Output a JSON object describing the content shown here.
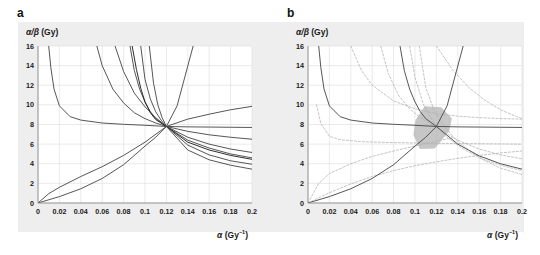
{
  "figure": {
    "background_color": "#ffffff",
    "band_color": "#eeeeee",
    "panels": [
      {
        "id": "a",
        "letter": "a",
        "axis_label_y": "α/β (Gy)",
        "axis_label_x": "α (Gy⁻¹)"
      },
      {
        "id": "b",
        "letter": "b",
        "axis_label_y": "α/β (Gy)",
        "axis_label_x": "α (Gy⁻¹)"
      }
    ]
  },
  "chart_data": [
    {
      "panel": "a",
      "type": "line",
      "title": "",
      "xlabel": "α (Gy⁻¹)",
      "ylabel": "α/β (Gy)",
      "xlim": [
        0,
        0.2
      ],
      "ylim": [
        0,
        16
      ],
      "xticks": [
        0,
        0.02,
        0.04,
        0.06,
        0.08,
        0.1,
        0.12,
        0.14,
        0.16,
        0.18,
        0.2
      ],
      "xticklabels": [
        "0",
        "0.02",
        "0.04",
        "0.06",
        "0.08",
        "0.1",
        "0.12",
        "0.14",
        "0.16",
        "0.18",
        "0.2"
      ],
      "yticks": [
        0,
        2,
        4,
        6,
        8,
        10,
        12,
        14,
        16
      ],
      "yticklabels": [
        "0",
        "2",
        "4",
        "6",
        "8",
        "10",
        "12",
        "14",
        "16"
      ],
      "grid": true,
      "legend": "none",
      "annotations": [
        "All isoeffect curves intersect at the common point (0.12, 7.8)"
      ],
      "common_point": {
        "alpha": 0.12,
        "alpha_beta": 7.8
      },
      "line_color": "#4d4d4d",
      "series": [
        {
          "name": "curve-1-steep-decay",
          "style": "solid",
          "color": "#4d4d4d",
          "x": [
            0.01,
            0.012,
            0.015,
            0.02,
            0.03,
            0.04,
            0.06,
            0.08,
            0.1,
            0.12,
            0.14,
            0.16,
            0.18,
            0.2
          ],
          "values": [
            16.0,
            13.8,
            11.6,
            9.9,
            8.8,
            8.45,
            8.15,
            8.02,
            7.92,
            7.8,
            7.76,
            7.74,
            7.72,
            7.7
          ]
        },
        {
          "name": "curve-2-decay",
          "style": "solid",
          "color": "#4d4d4d",
          "x": [
            0.055,
            0.06,
            0.07,
            0.08,
            0.09,
            0.1,
            0.11,
            0.12,
            0.14,
            0.16,
            0.18,
            0.2
          ],
          "values": [
            16.0,
            14.0,
            11.6,
            10.2,
            9.2,
            8.6,
            8.15,
            7.8,
            7.3,
            6.95,
            6.7,
            6.5
          ]
        },
        {
          "name": "curve-3-decay",
          "style": "solid",
          "color": "#4d4d4d",
          "x": [
            0.072,
            0.08,
            0.09,
            0.1,
            0.11,
            0.12,
            0.14,
            0.16,
            0.18,
            0.2
          ],
          "values": [
            16.0,
            13.4,
            11.2,
            9.8,
            8.7,
            7.8,
            6.7,
            6.0,
            5.5,
            5.15
          ]
        },
        {
          "name": "curve-4-decay",
          "style": "solid",
          "color": "#4d4d4d",
          "x": [
            0.086,
            0.09,
            0.095,
            0.1,
            0.105,
            0.11,
            0.12,
            0.14,
            0.16,
            0.18,
            0.2
          ],
          "values": [
            16.0,
            13.5,
            11.6,
            10.3,
            9.3,
            8.6,
            7.8,
            6.4,
            5.6,
            5.0,
            4.6
          ]
        },
        {
          "name": "curve-5-decay-dark",
          "style": "solid",
          "color": "#222222",
          "x": [
            0.088,
            0.092,
            0.096,
            0.1,
            0.105,
            0.11,
            0.12,
            0.14,
            0.16,
            0.18,
            0.2
          ],
          "values": [
            16.0,
            13.6,
            11.7,
            10.3,
            9.2,
            8.5,
            7.8,
            6.2,
            5.4,
            4.85,
            4.45
          ]
        },
        {
          "name": "curve-6-decay",
          "style": "solid",
          "color": "#4d4d4d",
          "x": [
            0.096,
            0.1,
            0.105,
            0.11,
            0.115,
            0.12,
            0.14,
            0.16,
            0.18,
            0.2
          ],
          "values": [
            16.0,
            12.6,
            10.6,
            9.3,
            8.45,
            7.8,
            5.9,
            4.9,
            4.3,
            3.95
          ]
        },
        {
          "name": "curve-7-decay",
          "style": "solid",
          "color": "#4d4d4d",
          "x": [
            0.104,
            0.108,
            0.112,
            0.116,
            0.12,
            0.14,
            0.16,
            0.18,
            0.2
          ],
          "values": [
            16.0,
            12.2,
            10.0,
            8.7,
            7.8,
            5.4,
            4.4,
            3.85,
            3.45
          ]
        },
        {
          "name": "curve-8-rising-shallow",
          "style": "solid",
          "color": "#4d4d4d",
          "x": [
            0.0,
            0.01,
            0.02,
            0.04,
            0.06,
            0.08,
            0.1,
            0.12,
            0.14,
            0.16,
            0.18,
            0.2
          ],
          "values": [
            0.0,
            0.95,
            1.6,
            2.7,
            3.7,
            4.85,
            6.2,
            7.8,
            8.55,
            9.05,
            9.5,
            9.85
          ]
        },
        {
          "name": "curve-9-rising-convex",
          "style": "solid",
          "color": "#4d4d4d",
          "x": [
            0.0,
            0.02,
            0.04,
            0.06,
            0.08,
            0.1,
            0.11,
            0.12,
            0.13,
            0.145
          ],
          "values": [
            0.0,
            0.65,
            1.45,
            2.5,
            3.9,
            5.8,
            6.7,
            7.8,
            9.9,
            16.0
          ]
        }
      ]
    },
    {
      "panel": "b",
      "type": "line",
      "title": "",
      "xlabel": "α (Gy⁻¹)",
      "ylabel": "α/β (Gy)",
      "xlim": [
        0,
        0.2
      ],
      "ylim": [
        0,
        16
      ],
      "xticks": [
        0,
        0.02,
        0.04,
        0.06,
        0.08,
        0.1,
        0.12,
        0.14,
        0.16,
        0.18,
        0.2
      ],
      "xticklabels": [
        "0",
        "0.02",
        "0.04",
        "0.06",
        "0.08",
        "0.1",
        "0.12",
        "0.14",
        "0.16",
        "0.18",
        "0.2"
      ],
      "yticks": [
        0,
        2,
        4,
        6,
        8,
        10,
        12,
        14,
        16
      ],
      "yticklabels": [
        "0",
        "2",
        "4",
        "6",
        "8",
        "10",
        "12",
        "14",
        "16"
      ],
      "grid": true,
      "legend": "none",
      "annotations": [
        "Three best-fit isoeffect curves (solid) with dashed confidence limits; shaded polygon marks the joint uncertainty region around the intersection (0.12, 7.8)"
      ],
      "common_point": {
        "alpha": 0.12,
        "alpha_beta": 7.8
      },
      "shaded_region": {
        "name": "uncertainty-polygon",
        "fill_color": "#b3b3b3",
        "opacity": 0.75,
        "vertices": [
          [
            0.1005,
            8.45
          ],
          [
            0.109,
            9.85
          ],
          [
            0.1245,
            9.75
          ],
          [
            0.1345,
            8.6
          ],
          [
            0.132,
            7.35
          ],
          [
            0.1185,
            5.55
          ],
          [
            0.1045,
            5.5
          ],
          [
            0.0985,
            6.95
          ]
        ]
      },
      "series": [
        {
          "name": "curve-b1-decay-solid",
          "style": "solid",
          "color": "#4d4d4d",
          "x": [
            0.01,
            0.012,
            0.015,
            0.02,
            0.03,
            0.04,
            0.06,
            0.08,
            0.1,
            0.12,
            0.14,
            0.16,
            0.18,
            0.2
          ],
          "values": [
            16.0,
            13.8,
            11.6,
            9.9,
            8.8,
            8.45,
            8.15,
            8.02,
            7.92,
            7.8,
            7.76,
            7.74,
            7.72,
            7.7
          ]
        },
        {
          "name": "curve-b2-decay-solid",
          "style": "solid",
          "color": "#4d4d4d",
          "x": [
            0.086,
            0.09,
            0.095,
            0.1,
            0.105,
            0.11,
            0.12,
            0.14,
            0.16,
            0.18,
            0.2
          ],
          "values": [
            16.0,
            13.5,
            11.6,
            10.3,
            9.3,
            8.6,
            7.8,
            6.0,
            4.8,
            4.0,
            3.45
          ]
        },
        {
          "name": "curve-b3-rising-solid",
          "style": "solid",
          "color": "#4d4d4d",
          "x": [
            0.0,
            0.02,
            0.04,
            0.06,
            0.08,
            0.1,
            0.11,
            0.12,
            0.13,
            0.145
          ],
          "values": [
            0.0,
            0.65,
            1.45,
            2.5,
            3.9,
            5.8,
            6.7,
            7.8,
            9.9,
            16.0
          ]
        },
        {
          "name": "curve-b1-upper-dashed",
          "style": "dashed",
          "color": "#b0b0b0",
          "x": [
            0.04,
            0.05,
            0.06,
            0.08,
            0.1,
            0.12,
            0.14,
            0.16,
            0.18,
            0.2
          ],
          "values": [
            16.0,
            13.5,
            12.0,
            10.4,
            9.6,
            9.1,
            8.85,
            8.7,
            8.6,
            8.55
          ]
        },
        {
          "name": "curve-b1-lower-dashed",
          "style": "dashed",
          "color": "#b0b0b0",
          "x": [
            0.008,
            0.012,
            0.02,
            0.03,
            0.05,
            0.07,
            0.1,
            0.12,
            0.15,
            0.18,
            0.2
          ],
          "values": [
            10.0,
            8.1,
            6.8,
            6.45,
            6.25,
            6.18,
            6.12,
            6.08,
            6.05,
            6.02,
            6.0
          ]
        },
        {
          "name": "curve-b2-upper-dashed",
          "style": "dashed",
          "color": "#b0b0b0",
          "x": [
            0.068,
            0.075,
            0.085,
            0.095,
            0.105,
            0.12,
            0.14,
            0.16,
            0.18,
            0.2
          ],
          "values": [
            16.0,
            13.2,
            10.9,
            9.6,
            8.7,
            7.7,
            6.4,
            5.5,
            4.9,
            4.5
          ]
        },
        {
          "name": "curve-b2-lower-dashed",
          "style": "dashed",
          "color": "#b0b0b0",
          "x": [
            0.104,
            0.11,
            0.118,
            0.128,
            0.14,
            0.16,
            0.18,
            0.2
          ],
          "values": [
            16.0,
            11.8,
            9.4,
            7.7,
            6.25,
            4.6,
            3.55,
            2.9
          ]
        },
        {
          "name": "curve-b3-upper-dashed",
          "style": "dashed",
          "color": "#b0b0b0",
          "x": [
            0.0,
            0.01,
            0.02,
            0.04,
            0.06,
            0.08,
            0.1,
            0.11,
            0.12,
            0.135
          ],
          "values": [
            0.0,
            2.0,
            3.0,
            4.0,
            4.75,
            5.3,
            5.8,
            6.05,
            6.3,
            6.65
          ]
        },
        {
          "name": "curve-b3-lower-dashed",
          "style": "dashed",
          "color": "#b0b0b0",
          "x": [
            0.0,
            0.02,
            0.04,
            0.06,
            0.08,
            0.1,
            0.12,
            0.14,
            0.16,
            0.18,
            0.2
          ],
          "values": [
            0.0,
            1.05,
            1.95,
            2.7,
            3.3,
            3.8,
            4.2,
            4.55,
            4.85,
            5.1,
            5.3
          ]
        },
        {
          "name": "curve-b3-far-upper-dashed",
          "style": "dashed",
          "color": "#b0b0b0",
          "x": [
            0.12,
            0.135,
            0.15,
            0.165,
            0.18,
            0.195,
            0.2
          ],
          "values": [
            16.0,
            13.6,
            11.8,
            10.5,
            9.5,
            8.8,
            8.6
          ]
        },
        {
          "name": "curve-b-inner-dashed",
          "style": "dashed",
          "color": "#b0b0b0",
          "x": [
            0.095,
            0.1,
            0.108,
            0.118,
            0.13,
            0.145,
            0.165,
            0.185,
            0.2
          ],
          "values": [
            16.0,
            12.8,
            10.0,
            8.1,
            6.7,
            5.5,
            4.4,
            3.7,
            3.3
          ]
        }
      ]
    }
  ]
}
